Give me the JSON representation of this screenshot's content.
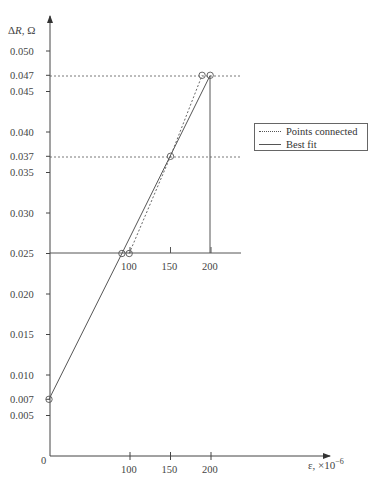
{
  "chart_data": {
    "type": "line",
    "title": "",
    "xlabel": "ε, ×10⁻⁶",
    "ylabel": "ΔR, Ω",
    "xlim": [
      0,
      220
    ],
    "ylim": [
      0,
      0.052
    ],
    "grid": false,
    "x_ticks": [
      100,
      150,
      200
    ],
    "y_ticks": [
      "0",
      "0.005",
      "0.007",
      "0.010",
      "0.015",
      "0.020",
      "0.025",
      "0.030",
      "0.035",
      "0.037",
      "0.040",
      "0.045",
      "0.047",
      "0.050"
    ],
    "legend_position": "right",
    "legend": [
      "Points connected",
      "Best fit"
    ],
    "series": [
      {
        "name": "Points connected",
        "style": "dotted",
        "x": [
          99,
          150,
          189
        ],
        "y": [
          0.025,
          0.037,
          0.047
        ]
      },
      {
        "name": "Best fit",
        "style": "solid",
        "x": [
          0,
          90,
          199
        ],
        "y": [
          0.007,
          0.025,
          0.047
        ]
      }
    ],
    "markers": [
      {
        "x": 0,
        "y": 0.007
      },
      {
        "x": 90,
        "y": 0.025
      },
      {
        "x": 99,
        "y": 0.025
      },
      {
        "x": 150,
        "y": 0.037
      },
      {
        "x": 189,
        "y": 0.047
      },
      {
        "x": 199,
        "y": 0.047
      }
    ],
    "reference_lines": [
      {
        "y": 0.047,
        "style": "dotted",
        "x_end": 238
      },
      {
        "y": 0.037,
        "style": "dotted",
        "x_end": 238
      },
      {
        "y": 0.025,
        "style": "solid",
        "x_end": 238,
        "note": "shifted inset x-axis",
        "ticks": [
          100,
          150,
          200
        ]
      },
      {
        "x": 199,
        "style": "solid",
        "y_from": 0.025,
        "y_to": 0.047
      }
    ],
    "annotations": []
  },
  "labels": {
    "ylabel": "ΔR, Ω",
    "xlabel": "ε, ×10",
    "xlabel_exp": "−6",
    "origin": "0",
    "legend_dotted": "Points connected",
    "legend_solid": "Best fit"
  },
  "y_tick_labels": [
    {
      "v": 0.05,
      "t": "0.050"
    },
    {
      "v": 0.047,
      "t": "0.047"
    },
    {
      "v": 0.045,
      "t": "0.045"
    },
    {
      "v": 0.04,
      "t": "0.040"
    },
    {
      "v": 0.037,
      "t": "0.037"
    },
    {
      "v": 0.035,
      "t": "0.035"
    },
    {
      "v": 0.03,
      "t": "0.030"
    },
    {
      "v": 0.025,
      "t": "0.025"
    },
    {
      "v": 0.02,
      "t": "0.020"
    },
    {
      "v": 0.015,
      "t": "0.015"
    },
    {
      "v": 0.01,
      "t": "0.010"
    },
    {
      "v": 0.007,
      "t": "0.007"
    },
    {
      "v": 0.005,
      "t": "0.005"
    }
  ],
  "x_tick_labels": [
    "100",
    "150",
    "200"
  ]
}
